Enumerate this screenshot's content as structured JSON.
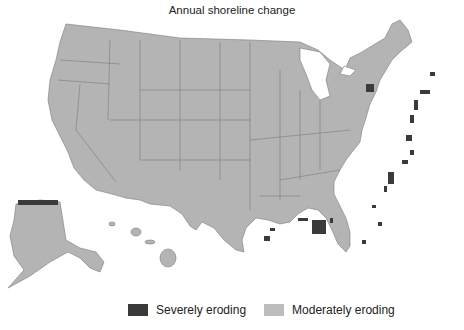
{
  "title": "Annual shoreline change",
  "colors": {
    "land": "#b4b4b4",
    "border": "#7a7a7a",
    "severe": "#3a3a3a",
    "moderate": "#bdbdbd",
    "water": "#ffffff"
  },
  "legend": {
    "items": [
      {
        "label": "Severely eroding",
        "color": "#3a3a3a"
      },
      {
        "label": "Moderately eroding",
        "color": "#bdbdbd"
      }
    ]
  },
  "regions": [
    "Contiguous United States",
    "Alaska",
    "Hawaii"
  ]
}
